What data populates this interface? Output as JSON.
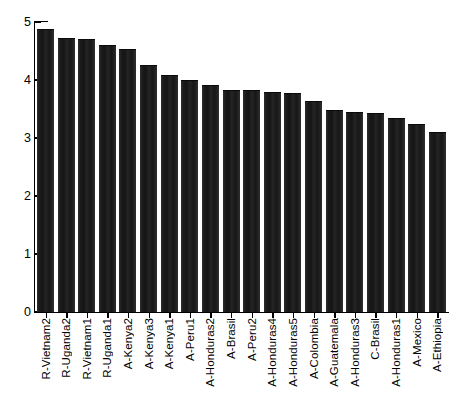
{
  "chart_data": {
    "type": "bar",
    "title": "",
    "subtitle": "",
    "xlabel": "",
    "ylabel": "",
    "ylim": [
      0,
      5
    ],
    "y_ticks": [
      0,
      1,
      2,
      3,
      4,
      5
    ],
    "y_tick_labels": [
      "0",
      "1",
      "2",
      "3",
      "4",
      "5"
    ],
    "grid": false,
    "legend": null,
    "bar_color": "#1a1a1a",
    "background_color": "#ffffff",
    "axis_color": "#000000",
    "x_tick_label_rotation": 90,
    "categories": [
      "R-Vietnam2",
      "R-Uganda2",
      "R-Vietnam1",
      "R-Uganda1",
      "A-Kenya2",
      "A-Kenya3",
      "A-Kenya1",
      "A-Peru1",
      "A-Honduras2",
      "A-Brasil",
      "A-Peru2",
      "A-Honduras4",
      "A-Honduras5",
      "A-Colombia",
      "A-Guatemala",
      "A-Honduras3",
      "C-Brasil",
      "A-Honduras1",
      "A-Mexico",
      "A-Ethiopia"
    ],
    "values": [
      4.88,
      4.72,
      4.7,
      4.6,
      4.53,
      4.26,
      4.09,
      4.0,
      3.91,
      3.83,
      3.83,
      3.8,
      3.78,
      3.64,
      3.48,
      3.45,
      3.43,
      3.35,
      3.24,
      3.1
    ]
  }
}
